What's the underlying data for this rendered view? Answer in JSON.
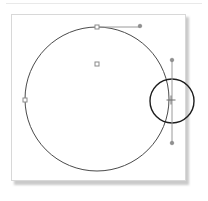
{
  "app": {
    "title": "Vector Canvas",
    "background_color": "#ffffff"
  },
  "artboard": {
    "name": "drawing-artboard",
    "x": 11,
    "y": 14,
    "width": 175,
    "height": 167,
    "fill_color": "#ffffff",
    "border_color": "#d8d8d8",
    "shadow_color": "#b9b9b9"
  },
  "shapes": [
    {
      "id": "main-circle",
      "type": "circle",
      "label": "Main Circle",
      "cx": 97,
      "cy": 99,
      "r": 72,
      "stroke_color": "#4a4a4a",
      "stroke_width": 1,
      "fill": "none",
      "selected": true
    },
    {
      "id": "small-circle",
      "type": "circle",
      "label": "Small Circle",
      "cx": 172,
      "cy": 101,
      "r": 22,
      "stroke_color": "#1e1e1e",
      "stroke_width": 1.4,
      "fill": "none",
      "selected": false
    }
  ],
  "guides": [
    {
      "id": "horizontal-guide",
      "type": "line",
      "label": "Horizontal Guide",
      "x1": 97,
      "y1": 27,
      "x2": 140,
      "y2": 27,
      "stroke_color": "#9a9a9a",
      "stroke_width": 1
    },
    {
      "id": "vertical-guide",
      "type": "line",
      "label": "Vertical Guide",
      "x1": 172,
      "y1": 60,
      "x2": 172,
      "y2": 143,
      "stroke_color": "#9a9a9a",
      "stroke_width": 1
    }
  ],
  "handles": [
    {
      "id": "handle-top",
      "shape": "square",
      "label": "Top Handle",
      "x": 97,
      "y": 27,
      "size": 4,
      "stroke_color": "#8a8a8a",
      "fill_color": "#ffffff"
    },
    {
      "id": "handle-left",
      "shape": "square",
      "label": "Left Handle",
      "x": 25,
      "y": 100,
      "size": 4,
      "stroke_color": "#8a8a8a",
      "fill_color": "#ffffff"
    },
    {
      "id": "handle-center",
      "shape": "square",
      "label": "Center Handle",
      "x": 97,
      "y": 64,
      "size": 4,
      "stroke_color": "#8a8a8a",
      "fill_color": "#ffffff"
    },
    {
      "id": "endpoint-guide-right",
      "shape": "dot",
      "label": "Guide Right Endpoint",
      "x": 140,
      "y": 26,
      "size": 3,
      "stroke_color": "#7d7d7d",
      "fill_color": "#8f8f8f"
    },
    {
      "id": "endpoint-guide-top",
      "shape": "dot",
      "label": "Guide Top Endpoint",
      "x": 172,
      "y": 60,
      "size": 3,
      "stroke_color": "#7d7d7d",
      "fill_color": "#8f8f8f"
    },
    {
      "id": "endpoint-guide-bottom",
      "shape": "dot",
      "label": "Guide Bottom Endpoint",
      "x": 172,
      "y": 143,
      "size": 3,
      "stroke_color": "#7d7d7d",
      "fill_color": "#8f8f8f"
    },
    {
      "id": "crosshair-center",
      "shape": "crosshair",
      "label": "Rotation Center",
      "x": 171,
      "y": 100,
      "size": 9,
      "stroke_color": "#6f6f6f",
      "fill_color": "none"
    }
  ]
}
